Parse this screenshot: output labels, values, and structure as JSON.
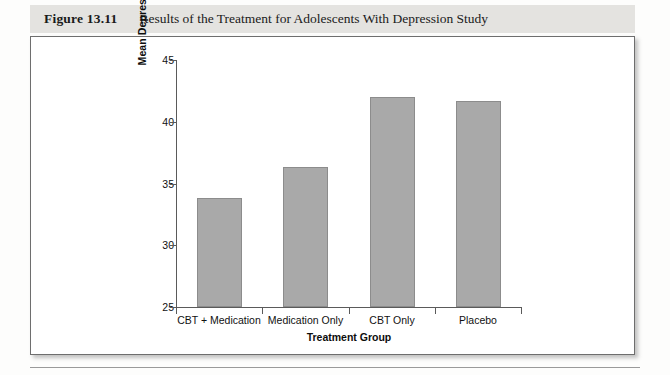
{
  "figure": {
    "number": "Figure 13.11",
    "caption": "Results of the Treatment for Adolescents With Depression Study"
  },
  "chart_data": {
    "type": "bar",
    "title": "Results of the Treatment for Adolescents With Depression Study",
    "categories": [
      "CBT + Medication",
      "Medication Only",
      "CBT Only",
      "Placebo"
    ],
    "values": [
      33.8,
      36.3,
      42.0,
      41.7
    ],
    "xlabel": "Treatment Group",
    "ylabel": "Mean Depression Score After Treatment",
    "ylim": [
      25,
      45
    ],
    "yticks": [
      25,
      30,
      35,
      40,
      45
    ],
    "ytick_labels": [
      "25",
      "30",
      "35",
      "40",
      "45"
    ],
    "grid": false,
    "legend": false,
    "bar_color": "#a9a9a9",
    "bar_edge_color": "#8c8c8c",
    "axis_color": "#5a5a5a"
  }
}
